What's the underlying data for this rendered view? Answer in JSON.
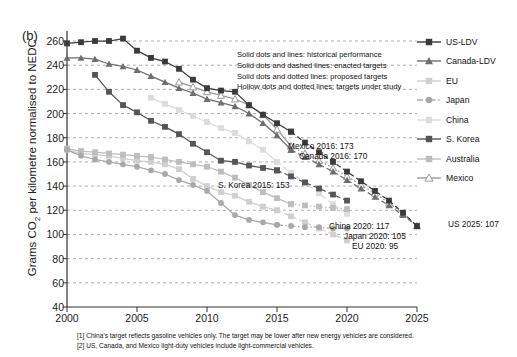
{
  "panel_label": "(b)",
  "notes": [
    "Solid dots and lines: historical performance",
    "Solid dots and dashed lines: enacted targets",
    "Solid dots and dotted lines: proposed targets",
    "Hollow dots and dotted lines: targets under study"
  ],
  "footnotes": [
    "[1] China's target reflects gasoline vehicles only. The target may be lower after new energy vehicles are considered.",
    "[2] US, Canada, and Mexico light-duty vehicles include light-commercial vehicles."
  ],
  "annotations": [
    {
      "text": "Mexico 2016: 173",
      "x": 288,
      "y": 141
    },
    {
      "text": "Canada 2016: 170",
      "x": 299,
      "y": 151
    },
    {
      "text": "S. Korea 2015: 153",
      "x": 218,
      "y": 180
    },
    {
      "text": "China 2020: 117",
      "x": 329,
      "y": 221
    },
    {
      "text": "Japan 2020: 105",
      "x": 344,
      "y": 231
    },
    {
      "text": "EU 2020: 95",
      "x": 352,
      "y": 241
    },
    {
      "text": "US 2025: 107",
      "x": 448,
      "y": 219
    }
  ],
  "legend": {
    "items": [
      {
        "label": "US-LDV",
        "marker": "square-filled",
        "color": "#3a3a3a",
        "line": "solid"
      },
      {
        "label": "Canada-LDV",
        "marker": "triangle-filled",
        "color": "#6e6e6e",
        "line": "solid"
      },
      {
        "label": "EU",
        "marker": "square-filled",
        "color": "#cfcfcf",
        "line": "solid"
      },
      {
        "label": "Japan",
        "marker": "circle-filled",
        "color": "#a8a8a8",
        "line": "dashdot"
      },
      {
        "label": "China",
        "marker": "square-filled",
        "color": "#dcdcdc",
        "line": "solid"
      },
      {
        "label": "S. Korea",
        "marker": "square-filled",
        "color": "#555555",
        "line": "solid"
      },
      {
        "label": "Australia",
        "marker": "square-filled",
        "color": "#bdbdbd",
        "line": "solid"
      },
      {
        "label": "Mexico",
        "marker": "triangle-hollow",
        "color": "#9a9a9a",
        "line": "solid"
      }
    ]
  },
  "chart_data": {
    "type": "line",
    "title": "",
    "xlabel": "",
    "ylabel": "Grams CO2 per kilometre normalised to NEDC",
    "xlim": [
      2000,
      2025
    ],
    "ylim": [
      40,
      260
    ],
    "xticks": [
      2000,
      2005,
      2010,
      2015,
      2020,
      2025
    ],
    "yticks": [
      40,
      60,
      80,
      100,
      120,
      140,
      160,
      180,
      200,
      220,
      240,
      260
    ],
    "grid": true,
    "legend_position": "right",
    "series": [
      {
        "name": "US-LDV",
        "color": "#3a3a3a",
        "marker": "square-filled",
        "hist": {
          "x": [
            2000,
            2001,
            2002,
            2003,
            2004,
            2005,
            2006,
            2007,
            2008,
            2009,
            2010,
            2011,
            2012,
            2013,
            2014,
            2015,
            2016
          ],
          "y": [
            258,
            259,
            260,
            260,
            262,
            252,
            246,
            243,
            237,
            228,
            221,
            219,
            218,
            207,
            199,
            192,
            185
          ]
        },
        "target": {
          "x": [
            2016,
            2017,
            2018,
            2019,
            2020,
            2021,
            2022,
            2023,
            2024,
            2025
          ],
          "y": [
            185,
            176,
            168,
            160,
            152,
            144,
            136,
            128,
            118,
            107
          ],
          "style": "dashed"
        }
      },
      {
        "name": "Canada-LDV",
        "color": "#6e6e6e",
        "marker": "triangle-filled",
        "hist": {
          "x": [
            2000,
            2001,
            2002,
            2003,
            2004,
            2005,
            2006,
            2007,
            2008,
            2009,
            2010,
            2011,
            2012,
            2013,
            2014,
            2015,
            2016
          ],
          "y": [
            246,
            246,
            245,
            241,
            239,
            236,
            231,
            226,
            221,
            217,
            212,
            209,
            206,
            200,
            192,
            182,
            170
          ]
        },
        "target": {
          "x": [
            2016,
            2017,
            2018,
            2019,
            2020,
            2021,
            2022,
            2023,
            2024,
            2025
          ],
          "y": [
            170,
            164,
            158,
            152,
            145,
            138,
            131,
            124,
            116,
            107
          ],
          "style": "dashed"
        }
      },
      {
        "name": "Mexico",
        "color": "#9a9a9a",
        "marker": "triangle-hollow",
        "hist": {
          "x": [
            2008,
            2009,
            2010,
            2011,
            2012,
            2013,
            2014,
            2015,
            2016
          ],
          "y": [
            226,
            222,
            218,
            215,
            212,
            207,
            199,
            187,
            173
          ]
        },
        "target": {
          "x": [
            2016,
            2017,
            2018,
            2019,
            2020,
            2021,
            2022,
            2023,
            2024,
            2025
          ],
          "y": [
            173,
            167,
            161,
            155,
            148,
            141,
            134,
            126,
            117,
            107
          ],
          "style": "dotted"
        }
      },
      {
        "name": "S. Korea",
        "color": "#555555",
        "marker": "square-filled",
        "hist": {
          "x": [
            2002,
            2003,
            2004,
            2005,
            2006,
            2007,
            2008,
            2009,
            2010,
            2011,
            2012,
            2013,
            2014,
            2015
          ],
          "y": [
            232,
            218,
            207,
            201,
            194,
            189,
            183,
            175,
            168,
            161,
            160,
            157,
            155,
            153
          ]
        },
        "target": {
          "x": [
            2015,
            2016,
            2017,
            2018,
            2019,
            2020
          ],
          "y": [
            153,
            148,
            143,
            138,
            133,
            128
          ],
          "style": "dashed"
        }
      },
      {
        "name": "EU",
        "color": "#cfcfcf",
        "marker": "square-filled",
        "hist": {
          "x": [
            2000,
            2001,
            2002,
            2003,
            2004,
            2005,
            2006,
            2007,
            2008,
            2009,
            2010,
            2011,
            2012,
            2013,
            2014,
            2015
          ],
          "y": [
            170,
            167,
            166,
            165,
            163,
            161,
            160,
            158,
            154,
            146,
            140,
            135,
            132,
            127,
            123,
            120
          ]
        },
        "target": {
          "x": [
            2015,
            2016,
            2017,
            2018,
            2019,
            2020
          ],
          "y": [
            120,
            115,
            110,
            105,
            100,
            95
          ],
          "style": "dashed"
        }
      },
      {
        "name": "Japan",
        "color": "#a8a8a8",
        "marker": "circle-filled",
        "hist": {
          "x": [
            2000,
            2001,
            2002,
            2003,
            2004,
            2005,
            2006,
            2007,
            2008,
            2009,
            2010,
            2011,
            2012,
            2013,
            2014,
            2015
          ],
          "y": [
            170,
            165,
            162,
            160,
            158,
            156,
            153,
            150,
            145,
            141,
            136,
            126,
            116,
            112,
            110,
            108
          ]
        },
        "target": {
          "x": [
            2015,
            2016,
            2017,
            2018,
            2019,
            2020
          ],
          "y": [
            108,
            107,
            106,
            106,
            105,
            105
          ],
          "style": "dashdot"
        }
      },
      {
        "name": "China",
        "color": "#dcdcdc",
        "marker": "square-filled",
        "hist": {
          "x": [
            2006,
            2007,
            2008,
            2009,
            2010,
            2011,
            2012,
            2013,
            2014,
            2015
          ],
          "y": [
            213,
            208,
            203,
            198,
            193,
            188,
            184,
            177,
            170,
            160
          ]
        },
        "target": {
          "x": [
            2015,
            2016,
            2017,
            2018,
            2019,
            2020
          ],
          "y": [
            160,
            151,
            143,
            134,
            125,
            117
          ],
          "style": "dashed"
        }
      },
      {
        "name": "Australia",
        "color": "#bdbdbd",
        "marker": "square-filled",
        "hist": {
          "x": [
            2000,
            2001,
            2002,
            2003,
            2004,
            2005,
            2006,
            2007,
            2008,
            2009,
            2010,
            2011,
            2012,
            2013,
            2014,
            2015,
            2016
          ],
          "y": [
            171,
            169,
            168,
            167,
            166,
            165,
            164,
            162,
            160,
            158,
            156,
            152,
            147,
            141,
            135,
            130,
            125
          ]
        },
        "target": {
          "x": [
            2016,
            2017,
            2018,
            2019,
            2020
          ],
          "y": [
            125,
            124,
            123,
            122,
            121
          ],
          "style": "dotted"
        }
      }
    ]
  }
}
